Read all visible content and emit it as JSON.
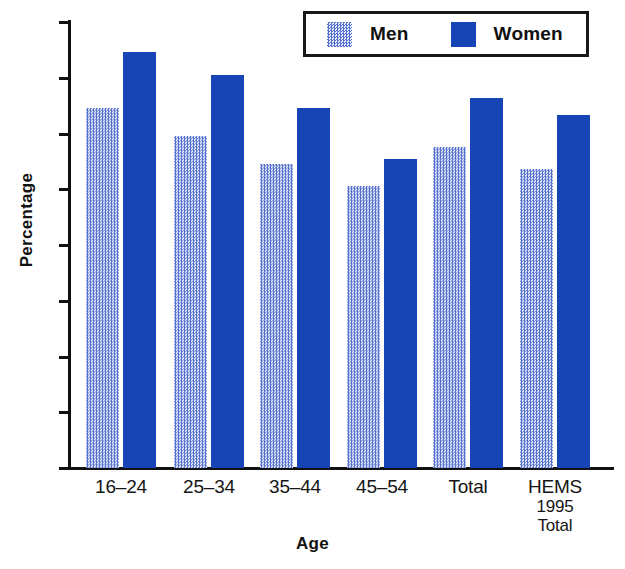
{
  "chart_data": {
    "type": "bar",
    "title": "",
    "subtitle": "",
    "xlabel": "Age",
    "ylabel": "Percentage",
    "categories": [
      "16–24",
      "25–34",
      "35–44",
      "45–54",
      "Total",
      "HEMS 1995 Total"
    ],
    "category_lines": [
      [
        "16–24"
      ],
      [
        "25–34"
      ],
      [
        "35–44"
      ],
      [
        "45–54"
      ],
      [
        "Total"
      ],
      [
        "HEMS",
        "1995",
        "Total"
      ]
    ],
    "series": [
      {
        "name": "Men",
        "values": [
          64.5,
          59.6,
          54.6,
          50.5,
          57.5,
          53.6
        ],
        "color": "#5571cf",
        "fill": "stipple"
      },
      {
        "name": "Women",
        "values": [
          74.6,
          70.5,
          64.5,
          55.5,
          66.4,
          63.4
        ],
        "color": "#1745b6",
        "fill": "solid"
      }
    ],
    "ylim": [
      0,
      80
    ],
    "yticks": [
      0,
      10,
      20,
      30,
      40,
      50,
      60,
      70,
      80
    ],
    "ytick_labels": [
      "0",
      "10",
      "20",
      "30",
      "40",
      "50",
      "60",
      "70",
      "80"
    ],
    "grid": false,
    "legend_position": "top-right",
    "legend_entries": [
      "Men",
      "Women"
    ]
  },
  "legend": {
    "men_label": "Men",
    "women_label": "Women"
  },
  "axes": {
    "x_title": "Age",
    "y_title": "Percentage"
  },
  "colors": {
    "men": "#5571cf",
    "women": "#1745b6",
    "axis": "#111111",
    "background": "#ffffff"
  }
}
